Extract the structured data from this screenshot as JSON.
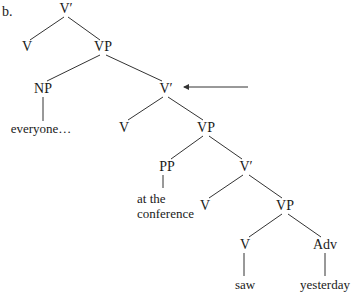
{
  "example_label": "b.",
  "arrow": {
    "from": [
      248,
      87
    ],
    "to": [
      183,
      87
    ],
    "points_to": "V′ (second)"
  },
  "nodes": {
    "n1": {
      "label": "V′",
      "x": 66,
      "y": 9
    },
    "n2": {
      "label": "V",
      "x": 27,
      "y": 47
    },
    "n3": {
      "label": "VP",
      "x": 103,
      "y": 47
    },
    "n4": {
      "label": "NP",
      "x": 43,
      "y": 89
    },
    "n5": {
      "label": "everyone…",
      "x": 41,
      "y": 129
    },
    "n6": {
      "label": "V′",
      "x": 166,
      "y": 89
    },
    "n7": {
      "label": "V",
      "x": 124,
      "y": 128
    },
    "n8": {
      "label": "VP",
      "x": 206,
      "y": 128
    },
    "n9": {
      "label": "PP",
      "x": 167,
      "y": 167
    },
    "n10": {
      "line1": "at the",
      "line2": "conference",
      "x": 137,
      "y": 191
    },
    "n11": {
      "label": "V′",
      "x": 246,
      "y": 167
    },
    "n12": {
      "label": "V",
      "x": 205,
      "y": 206
    },
    "n13": {
      "label": "VP",
      "x": 285,
      "y": 206
    },
    "n14": {
      "label": "V",
      "x": 245,
      "y": 245
    },
    "n15": {
      "label": "Adv",
      "x": 325,
      "y": 245
    },
    "n16": {
      "label": "saw",
      "x": 245,
      "y": 285
    },
    "n17": {
      "label": "yesterday",
      "x": 325,
      "y": 285
    }
  },
  "edges": [
    [
      "n1",
      "n2"
    ],
    [
      "n1",
      "n3"
    ],
    [
      "n3",
      "n4"
    ],
    [
      "n3",
      "n6"
    ],
    [
      "n4",
      "n5"
    ],
    [
      "n6",
      "n7"
    ],
    [
      "n6",
      "n8"
    ],
    [
      "n8",
      "n9"
    ],
    [
      "n8",
      "n11"
    ],
    [
      "n9",
      "n10"
    ],
    [
      "n11",
      "n12"
    ],
    [
      "n11",
      "n13"
    ],
    [
      "n13",
      "n14"
    ],
    [
      "n13",
      "n15"
    ],
    [
      "n14",
      "n16"
    ],
    [
      "n15",
      "n17"
    ]
  ]
}
